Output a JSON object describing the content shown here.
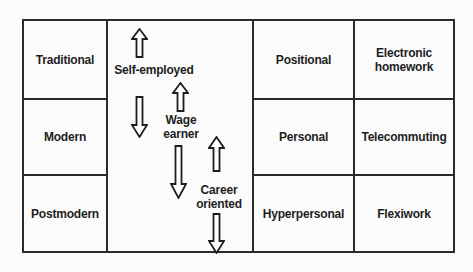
{
  "diagram": {
    "stages": [
      {
        "label": "Traditional"
      },
      {
        "label": "Modern"
      },
      {
        "label": "Postmodern"
      }
    ],
    "employment_types": [
      {
        "label": "Self-employed",
        "arrows": [
          "up",
          "down"
        ]
      },
      {
        "label": "Wage earner",
        "arrows": [
          "up",
          "down"
        ]
      },
      {
        "label": "Career oriented",
        "arrows": [
          "up",
          "down"
        ]
      }
    ],
    "relationship_types": [
      {
        "label": "Positional"
      },
      {
        "label": "Personal"
      },
      {
        "label": "Hyperpersonal"
      }
    ],
    "work_forms": [
      {
        "label": "Electronic homework"
      },
      {
        "label": "Telecommuting"
      },
      {
        "label": "Flexiwork"
      }
    ],
    "colors": {
      "line": "#2a2a2a",
      "text": "#1e1e1e",
      "background": "#fbfbfb"
    }
  }
}
